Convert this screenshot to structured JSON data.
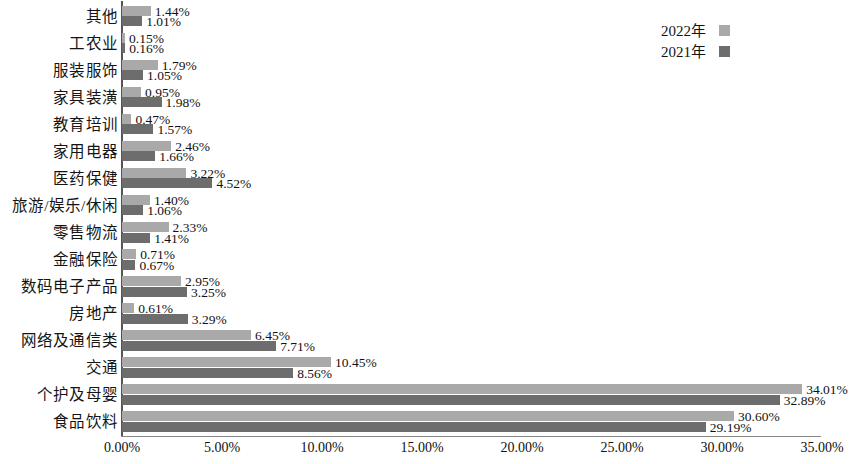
{
  "chart_data": {
    "type": "bar",
    "orientation": "horizontal",
    "title": "",
    "subtitle": "",
    "xlabel": "",
    "ylabel": "",
    "xlim": [
      0,
      35
    ],
    "grid": false,
    "legend_position": "top-right",
    "value_label_suffix": "%",
    "axis_tick_labels": [
      "0.00%",
      "5.00%",
      "10.00%",
      "15.00%",
      "20.00%",
      "25.00%",
      "30.00%",
      "35.00%"
    ],
    "axis_tick_values": [
      0,
      5,
      10,
      15,
      20,
      25,
      30,
      35
    ],
    "categories": [
      "其他",
      "工农业",
      "服装服饰",
      "家具装潢",
      "教育培训",
      "家用电器",
      "医药保健",
      "旅游/娱乐/休闲",
      "零售物流",
      "金融保险",
      "数码电子产品",
      "房地产",
      "网络及通信类",
      "交通",
      "个护及母婴",
      "食品饮料"
    ],
    "series": [
      {
        "name": "2022年",
        "color": "#a9a9a9",
        "values": [
          1.44,
          0.15,
          1.79,
          0.95,
          0.47,
          2.46,
          3.22,
          1.4,
          2.33,
          0.71,
          2.95,
          0.61,
          6.45,
          10.45,
          34.01,
          30.6
        ],
        "labels": [
          "1.44%",
          "0.15%",
          "1.79%",
          "0.95%",
          "0.47%",
          "2.46%",
          "3.22%",
          "1.40%",
          "2.33%",
          "0.71%",
          "2.95%",
          "0.61%",
          "6.45%",
          "10.45%",
          "34.01%",
          "30.60%"
        ]
      },
      {
        "name": "2021年",
        "color": "#6d6d6d",
        "values": [
          1.01,
          0.16,
          1.05,
          1.98,
          1.57,
          1.66,
          4.52,
          1.06,
          1.41,
          0.67,
          3.25,
          3.29,
          7.71,
          8.56,
          32.89,
          29.19
        ],
        "labels": [
          "1.01%",
          "0.16%",
          "1.05%",
          "1.98%",
          "1.57%",
          "1.66%",
          "4.52%",
          "1.06%",
          "1.41%",
          "0.67%",
          "3.25%",
          "3.29%",
          "7.71%",
          "8.56%",
          "32.89%",
          "29.19%"
        ]
      }
    ]
  },
  "legend": {
    "items": [
      {
        "label": "2022年",
        "swatch": "y2022"
      },
      {
        "label": "2021年",
        "swatch": "y2021"
      }
    ]
  }
}
